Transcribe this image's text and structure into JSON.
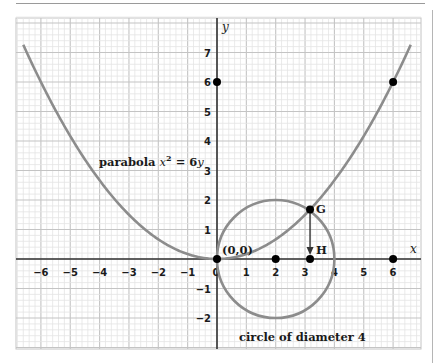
{
  "chart_data": {
    "type": "line",
    "title": "",
    "xlabel": "x",
    "ylabel": "y",
    "xlim": [
      -6.84,
      6.94
    ],
    "ylim": [
      -3.06,
      8.2
    ],
    "grid": true,
    "x_ticks": [
      "-6",
      "-5",
      "-4",
      "-3",
      "-2",
      "-1",
      "0",
      "1",
      "2",
      "3",
      "4",
      "5",
      "6"
    ],
    "y_ticks": [
      "7",
      "6",
      "5",
      "4",
      "3",
      "2",
      "1",
      "-1",
      "-2"
    ],
    "series": [
      {
        "name": "parabola x^2 = 6y",
        "equation": "x^2 = 6y",
        "x_range": [
          -6.6,
          6.6
        ]
      },
      {
        "name": "circle of diameter 4",
        "center": [
          2,
          0
        ],
        "radius": 2
      }
    ],
    "points": [
      {
        "label": "(0,0)",
        "x": 0,
        "y": 0
      },
      {
        "label": "G",
        "x": 3.17,
        "y": 1.68
      },
      {
        "label": "H",
        "x": 3.17,
        "y": 0
      },
      {
        "label": "",
        "x": 2,
        "y": 0
      },
      {
        "label": "",
        "x": 6,
        "y": 0
      },
      {
        "label": "",
        "x": 0,
        "y": 6
      },
      {
        "label": "",
        "x": 6,
        "y": 6
      }
    ],
    "annotations": [
      {
        "text": "parabola",
        "math": "x² = 6y"
      },
      {
        "text": "circle of diameter 4"
      },
      {
        "text": "arrow from G down to H"
      }
    ]
  },
  "labels": {
    "parabola_word": "parabola ",
    "parabola_eq_x": "x",
    "parabola_eq_exp": "2",
    "parabola_eq_rest": " = 6",
    "parabola_eq_y": "y",
    "circle": "circle of diameter 4",
    "origin": "(0,0)",
    "G": "G",
    "H": "H",
    "x_axis": "x",
    "y_axis": "y"
  },
  "colors": {
    "curve": "#8c8c8c",
    "axis": "#333333",
    "grid_major": "#c4c4c4",
    "grid_minor": "#e4e4e4",
    "point": "#000000"
  }
}
